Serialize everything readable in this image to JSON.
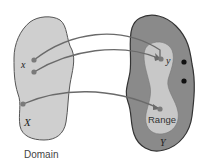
{
  "diagram": {
    "domain_set": {
      "label": "Domain",
      "set_symbol": "X",
      "element_symbol": "x",
      "fill": "#cfcfcf",
      "stroke": "#555555"
    },
    "codomain_set": {
      "set_symbol": "Y",
      "fill": "#8a8a8a",
      "stroke": "#333333"
    },
    "range_set": {
      "label": "Range",
      "element_symbol": "y",
      "fill": "#c8c8c8"
    },
    "arrow_color": "#6a6a6a",
    "point_color": "#7a7a7a",
    "extra_point_color": "#111111"
  }
}
